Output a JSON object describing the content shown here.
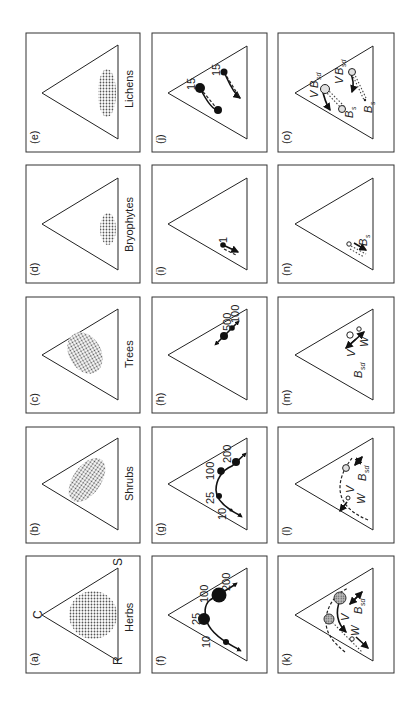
{
  "figure": {
    "orientation": "rotated 90 degrees counter-clockwise",
    "colors": {
      "ink": "#222222",
      "frame": "#333333",
      "stipple": "#555555",
      "hollow_fill": "#e0e0e0",
      "hatched_fill": "#9a9a9a",
      "background": "#ffffff"
    },
    "vertex_labels": {
      "C": "C",
      "R": "R",
      "S": "S"
    },
    "panels": [
      {
        "id": "a",
        "label": "(a)",
        "title": "Herbs",
        "type": "distribution"
      },
      {
        "id": "b",
        "label": "(b)",
        "title": "Shrubs",
        "type": "distribution"
      },
      {
        "id": "c",
        "label": "(c)",
        "title": "Trees",
        "type": "distribution"
      },
      {
        "id": "d",
        "label": "(d)",
        "title": "Bryophytes",
        "type": "distribution"
      },
      {
        "id": "e",
        "label": "(e)",
        "title": "Lichens",
        "type": "distribution"
      },
      {
        "id": "f",
        "label": "(f)",
        "type": "trajectory",
        "numbers": [
          "10",
          "25",
          "100",
          "200"
        ]
      },
      {
        "id": "g",
        "label": "(g)",
        "type": "trajectory",
        "numbers": [
          "10",
          "25",
          "100",
          "200"
        ]
      },
      {
        "id": "h",
        "label": "(h)",
        "type": "trajectory",
        "numbers": [
          "500",
          "100"
        ]
      },
      {
        "id": "i",
        "label": "(i)",
        "type": "trajectory",
        "numbers": [
          "1"
        ]
      },
      {
        "id": "j",
        "label": "(j)",
        "type": "trajectory",
        "numbers": [
          "15",
          "15"
        ]
      },
      {
        "id": "k",
        "label": "(k)",
        "type": "regeneration",
        "symbols": [
          "V",
          "W",
          "B",
          "sd"
        ]
      },
      {
        "id": "l",
        "label": "(l)",
        "type": "regeneration",
        "symbols": [
          "V",
          "W",
          "B",
          "sd"
        ]
      },
      {
        "id": "m",
        "label": "(m)",
        "type": "regeneration",
        "symbols": [
          "B",
          "sd",
          "V",
          "W"
        ]
      },
      {
        "id": "n",
        "label": "(n)",
        "type": "regeneration",
        "symbols": [
          "B",
          "s"
        ]
      },
      {
        "id": "o",
        "label": "(o)",
        "type": "regeneration",
        "symbols": [
          "V",
          "B",
          "sd",
          "V",
          "B",
          "sd",
          "B",
          "s",
          "B",
          "s"
        ]
      }
    ]
  }
}
